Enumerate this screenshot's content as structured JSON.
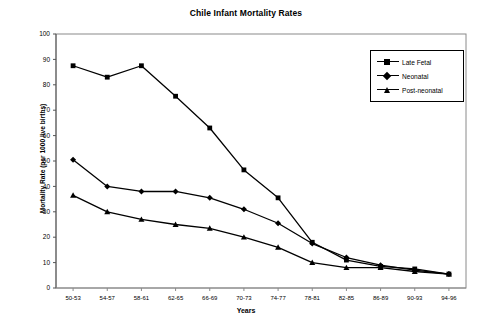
{
  "chart_data": {
    "type": "line",
    "title": "Chile Infant Mortality Rates",
    "xlabel": "Years",
    "ylabel": "Mortality Rate (per 1000 live births)",
    "ylim": [
      0,
      100
    ],
    "ytick_step": 10,
    "yticks": [
      0,
      10,
      20,
      30,
      40,
      50,
      60,
      70,
      80,
      90,
      100
    ],
    "grid": false,
    "legend_position": "top-right",
    "categories": [
      "50-53",
      "54-57",
      "58-61",
      "62-65",
      "66-69",
      "70-73",
      "74-77",
      "78-81",
      "82-85",
      "86-89",
      "90-93",
      "94-96"
    ],
    "series": [
      {
        "name": "Late Fetal",
        "marker": "square",
        "values": [
          87.5,
          83,
          87.5,
          75.5,
          63,
          46.5,
          35.5,
          18,
          11,
          8.5,
          7.5,
          5.5
        ]
      },
      {
        "name": "Neonatal",
        "marker": "diamond",
        "values": [
          50.5,
          40,
          38,
          38,
          35.5,
          31,
          25.5,
          17.5,
          12,
          9,
          7,
          5.5
        ]
      },
      {
        "name": "Post-neonatal",
        "marker": "triangle",
        "values": [
          36.5,
          30,
          27,
          25,
          23.5,
          20,
          16,
          10,
          8,
          8,
          6.5,
          5.5
        ]
      }
    ]
  },
  "legend": {
    "items": [
      {
        "label": "Late Fetal"
      },
      {
        "label": "Neonatal"
      },
      {
        "label": "Post-neonatal"
      }
    ]
  }
}
